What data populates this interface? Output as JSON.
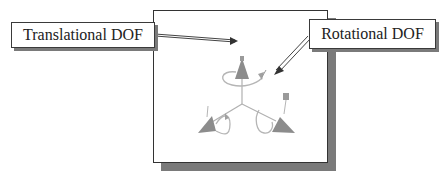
{
  "diagram": {
    "labels": {
      "translational": "Translational DOF",
      "rotational": "Rotational DOF"
    },
    "icon": "joint-dof-triad-icon",
    "colors": {
      "cone": "#8c8c8c",
      "loop": "#b5b5b5",
      "shadow": "#7a7a7a",
      "border": "#333333",
      "arrow": "#444444"
    }
  }
}
